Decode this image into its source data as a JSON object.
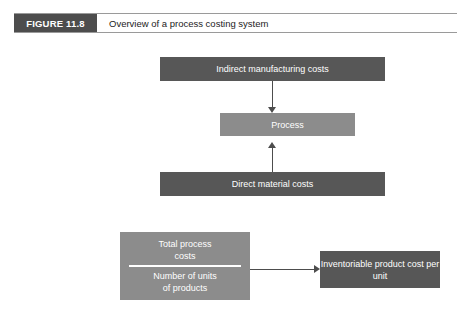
{
  "figure": {
    "tag": "FIGURE 11.8",
    "title": "Overview of a process costing system"
  },
  "diagram": {
    "type": "flow",
    "nodes": {
      "indirect": "Indirect manufacturing costs",
      "process": "Process",
      "direct": "Direct material costs",
      "result": "Inventoriable product cost per unit"
    },
    "formula": {
      "numerator_line1": "Total process",
      "numerator_line2": "costs",
      "denominator_line1": "Number of units",
      "denominator_line2": "of products"
    }
  },
  "colors": {
    "box_dark": "#575757",
    "box_mid": "#8c8c8c",
    "tag_bg": "#4d4d4d",
    "connector": "#4d4d4d",
    "text_on_box": "#ffffff",
    "page_bg": "#ffffff"
  }
}
